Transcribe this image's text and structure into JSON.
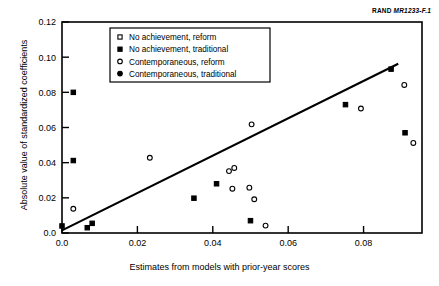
{
  "figure": {
    "source_label_prefix": "RAND",
    "source_label_id": "MR1233-F.1"
  },
  "chart_data": {
    "type": "scatter",
    "title": "",
    "xlabel": "Estimates from models with prior-year scores",
    "ylabel": "Absolute value of standardized coefficients",
    "xlim": [
      0.0,
      0.0955
    ],
    "ylim": [
      0.0,
      0.12
    ],
    "xticks": [
      0.0,
      0.02,
      0.04,
      0.06,
      0.08
    ],
    "xtick_labels": [
      "0.0",
      "0.02",
      "0.04",
      "0.06",
      "0.08"
    ],
    "yticks": [
      0.0,
      0.02,
      0.04,
      0.06,
      0.08,
      0.1,
      0.12
    ],
    "ytick_labels": [
      "0.0",
      "0.02",
      "0.04",
      "0.06",
      "0.08",
      "0.10",
      "0.12"
    ],
    "grid": false,
    "legend_position": "top-center",
    "legend_entries": [
      {
        "marker": "open-square",
        "label": "No achievement, reform"
      },
      {
        "marker": "filled-square",
        "label": "No achievement, traditional"
      },
      {
        "marker": "open-circle",
        "label": "Contemporaneous, reform"
      },
      {
        "marker": "filled-circle",
        "label": "Contemporaneous, traditional"
      }
    ],
    "reference_line": {
      "label": "trend line",
      "x": [
        0.0,
        0.0892
      ],
      "y": [
        0.0015,
        0.0962
      ]
    },
    "series": [
      {
        "name": "No achievement, reform",
        "marker": "open-square",
        "points": []
      },
      {
        "name": "No achievement, traditional",
        "marker": "filled-square",
        "points": [
          {
            "x": 0.003,
            "y": 0.08
          },
          {
            "x": 0.003,
            "y": 0.0412
          },
          {
            "x": 0.0,
            "y": 0.004
          },
          {
            "x": 0.0067,
            "y": 0.003
          },
          {
            "x": 0.008,
            "y": 0.0055
          },
          {
            "x": 0.035,
            "y": 0.0198
          },
          {
            "x": 0.041,
            "y": 0.028
          },
          {
            "x": 0.05,
            "y": 0.007
          },
          {
            "x": 0.0752,
            "y": 0.073
          },
          {
            "x": 0.0873,
            "y": 0.0932
          },
          {
            "x": 0.091,
            "y": 0.057
          }
        ]
      },
      {
        "name": "Contemporaneous, reform",
        "marker": "open-circle",
        "points": [
          {
            "x": 0.003,
            "y": 0.0138
          },
          {
            "x": 0.0233,
            "y": 0.0428
          },
          {
            "x": 0.0443,
            "y": 0.0352
          },
          {
            "x": 0.0457,
            "y": 0.037
          },
          {
            "x": 0.0452,
            "y": 0.0252
          },
          {
            "x": 0.0497,
            "y": 0.0258
          },
          {
            "x": 0.051,
            "y": 0.0192
          },
          {
            "x": 0.0503,
            "y": 0.0618
          },
          {
            "x": 0.054,
            "y": 0.0042
          },
          {
            "x": 0.0793,
            "y": 0.0708
          },
          {
            "x": 0.0908,
            "y": 0.0842
          },
          {
            "x": 0.0932,
            "y": 0.0512
          }
        ]
      },
      {
        "name": "Contemporaneous, traditional",
        "marker": "filled-circle",
        "points": []
      }
    ]
  }
}
